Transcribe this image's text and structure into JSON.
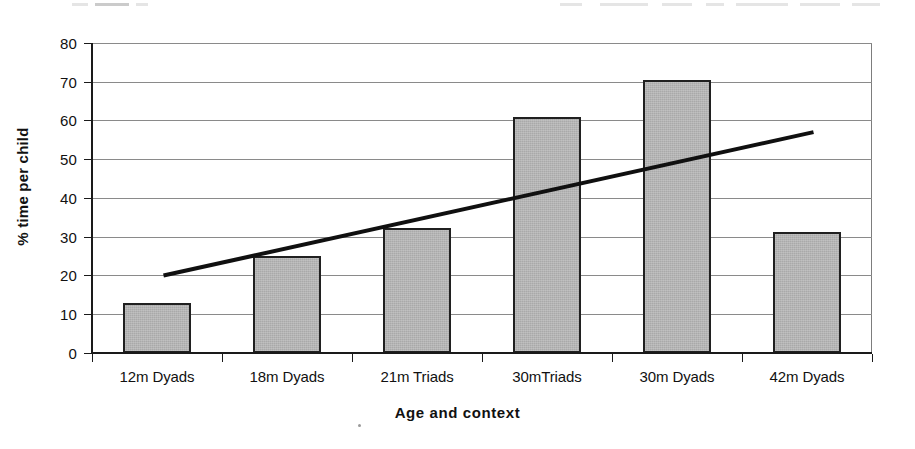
{
  "figure": {
    "background_color": "#ffffff",
    "ink_color": "#111111",
    "bar_fill_color": "#a9a9a9",
    "bar_border_color": "#202020",
    "gridline_color": "#8a8a8a",
    "trendline_color": "#101010"
  },
  "chart_data": {
    "type": "bar",
    "title": "",
    "xlabel": "Age and context",
    "ylabel": "% time per child",
    "categories": [
      "12m Dyads",
      "18m Dyads",
      "21m Triads",
      "30mTriads",
      "30m Dyads",
      "42m Dyads"
    ],
    "values": [
      13,
      25,
      32.3,
      61,
      70.5,
      31.2
    ],
    "ylim": [
      0,
      80
    ],
    "ytick_step": 10,
    "yticks": [
      0,
      10,
      20,
      30,
      40,
      50,
      60,
      70,
      80
    ],
    "ytick_labels": [
      "0",
      "10",
      "20",
      "30",
      "40",
      "50",
      "60",
      "70",
      "80"
    ],
    "grid": true,
    "grid_axis": "y",
    "legend": false,
    "legend_position": "none",
    "series": [
      {
        "name": "% time per child",
        "type": "bar",
        "values": [
          13,
          25,
          32.3,
          61,
          70.5,
          31.2
        ]
      },
      {
        "name": "Linear trend",
        "type": "line",
        "start_value": 20,
        "end_value": 57,
        "start_category_index": 0.55,
        "end_category_index": 5.55
      }
    ]
  },
  "annotations": {
    "scan_note": ""
  }
}
